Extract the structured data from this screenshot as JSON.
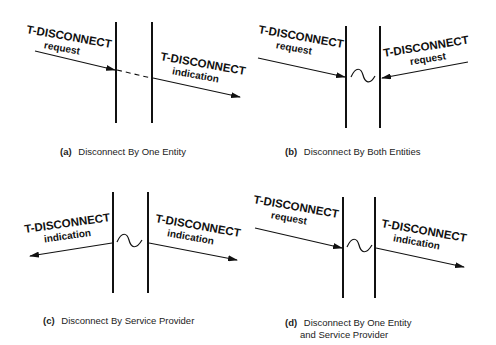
{
  "figure": {
    "panels": [
      {
        "id": "a",
        "caption_tag": "(a)",
        "caption": "Disconnect By One Entity",
        "caption_line2": "",
        "left_label": {
          "primitive": "T-DISCONNECT",
          "type": "request",
          "direction": "into-provider"
        },
        "right_label": {
          "primitive": "T-DISCONNECT",
          "type": "indication",
          "direction": "out-of-provider"
        },
        "provider_symbol": "dashed-pass-through"
      },
      {
        "id": "b",
        "caption_tag": "(b)",
        "caption": "Disconnect By Both Entities",
        "caption_line2": "",
        "left_label": {
          "primitive": "T-DISCONNECT",
          "type": "request",
          "direction": "into-provider"
        },
        "right_label": {
          "primitive": "T-DISCONNECT",
          "type": "request",
          "direction": "into-provider"
        },
        "provider_symbol": "tilde"
      },
      {
        "id": "c",
        "caption_tag": "(c)",
        "caption": "Disconnect By Service Provider",
        "caption_line2": "",
        "left_label": {
          "primitive": "T-DISCONNECT",
          "type": "indication",
          "direction": "out-of-provider"
        },
        "right_label": {
          "primitive": "T-DISCONNECT",
          "type": "indication",
          "direction": "out-of-provider"
        },
        "provider_symbol": "tilde"
      },
      {
        "id": "d",
        "caption_tag": "(d)",
        "caption": "Disconnect By One Entity",
        "caption_line2": "and Service Provider",
        "left_label": {
          "primitive": "T-DISCONNECT",
          "type": "request",
          "direction": "into-provider"
        },
        "right_label": {
          "primitive": "T-DISCONNECT",
          "type": "indication",
          "direction": "out-of-provider"
        },
        "provider_symbol": "tilde"
      }
    ]
  }
}
